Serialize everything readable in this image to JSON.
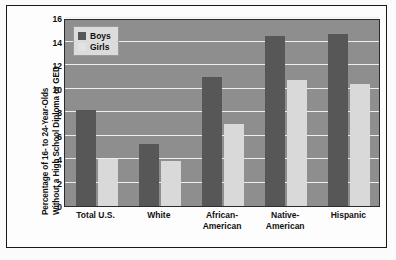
{
  "chart_data": {
    "type": "bar",
    "title": "",
    "xlabel": "",
    "ylabel_line1": "Percentage of 16- to 24-Year-Olds",
    "ylabel_line2": "Without a High School Diploma or GED",
    "categories": [
      "Total U.S.",
      "White",
      "African-American",
      "Native-American",
      "Hispanic"
    ],
    "category_lines": [
      [
        "Total U.S.",
        ""
      ],
      [
        "White",
        ""
      ],
      [
        "African-",
        "American"
      ],
      [
        "Native-",
        "American"
      ],
      [
        "Hispanic",
        ""
      ]
    ],
    "series": [
      {
        "name": "Boys",
        "color": "#575757",
        "values": [
          8.2,
          5.3,
          11.0,
          14.5,
          14.6
        ]
      },
      {
        "name": "Girls",
        "color": "#d9d9d9",
        "values": [
          4.0,
          3.8,
          7.0,
          10.7,
          10.4
        ]
      }
    ],
    "ylim": [
      0,
      16
    ],
    "yticks": [
      0,
      2,
      4,
      6,
      8,
      10,
      12,
      14,
      16
    ],
    "ytick_labels": [
      "0",
      "2",
      "4",
      "6",
      "8",
      "10",
      "12",
      "14",
      "16"
    ],
    "grid": true,
    "gridline_color": "#ededed",
    "plot_background": "#8e8e8e",
    "legend_position": "upper-left",
    "legend_entries": [
      "Boys",
      "Girls"
    ]
  }
}
